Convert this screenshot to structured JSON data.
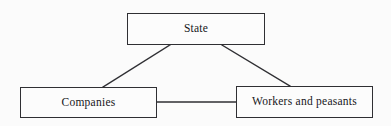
{
  "diagram": {
    "type": "relationship-triangle",
    "background_color": "#fbfbfb",
    "stroke_color": "#2f2f33",
    "text_color": "#16161a",
    "nodes": [
      {
        "id": "state",
        "label": "State",
        "shape": "rectangle",
        "x": 127,
        "y": 13,
        "width": 138,
        "height": 32
      },
      {
        "id": "companies",
        "label": "Companies",
        "shape": "rectangle",
        "x": 20,
        "y": 87,
        "width": 137,
        "height": 31
      },
      {
        "id": "workers",
        "label": "Workers and peasants",
        "shape": "rectangle",
        "x": 236,
        "y": 86,
        "width": 137,
        "height": 32
      }
    ],
    "edges": [
      {
        "id": "state-companies",
        "from": "state",
        "to": "companies",
        "style": "solid-line",
        "x1": 170,
        "y1": 45,
        "x2": 103,
        "y2": 87
      },
      {
        "id": "state-workers",
        "from": "state",
        "to": "workers",
        "style": "solid-line",
        "x1": 222,
        "y1": 45,
        "x2": 290,
        "y2": 86
      },
      {
        "id": "companies-workers",
        "from": "companies",
        "to": "workers",
        "style": "solid-line",
        "x1": 157,
        "y1": 102,
        "x2": 236,
        "y2": 102
      }
    ]
  }
}
